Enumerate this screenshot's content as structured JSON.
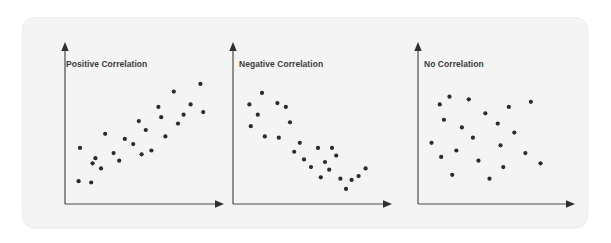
{
  "page": {
    "background_color": "#ffffff",
    "card_background_color": "#f4f4f4",
    "card_border_color": "#ededed"
  },
  "margin_artifacts": [
    {
      "glyph": "·",
      "x": 597,
      "y": 27
    },
    {
      "glyph": "·",
      "x": 596,
      "y": 40
    },
    {
      "glyph": "·",
      "x": 595,
      "y": 180
    },
    {
      "glyph": "·",
      "x": 595,
      "y": 200
    }
  ],
  "chart_data": [
    {
      "type": "scatter",
      "title": "Positive Correlation",
      "xlabel": "",
      "ylabel": "",
      "xlim": [
        0,
        100
      ],
      "ylim": [
        0,
        100
      ],
      "grid": false,
      "legend": "none",
      "axis_style": "arrow-headed L-shaped axes, no tick labels",
      "point_color": "#2b2b2b",
      "point_count": 24,
      "points": [
        [
          4,
          10
        ],
        [
          5,
          36
        ],
        [
          13,
          9
        ],
        [
          14,
          24
        ],
        [
          16,
          28
        ],
        [
          20,
          20
        ],
        [
          23,
          47
        ],
        [
          29,
          32
        ],
        [
          33,
          26
        ],
        [
          37,
          43
        ],
        [
          43,
          39
        ],
        [
          47,
          57
        ],
        [
          49,
          31
        ],
        [
          52,
          50
        ],
        [
          56,
          34
        ],
        [
          61,
          68
        ],
        [
          63,
          60
        ],
        [
          66,
          45
        ],
        [
          72,
          80
        ],
        [
          75,
          55
        ],
        [
          79,
          62
        ],
        [
          84,
          70
        ],
        [
          91,
          86
        ],
        [
          93,
          64
        ]
      ]
    },
    {
      "type": "scatter",
      "title": "Negative Correlation",
      "xlabel": "",
      "ylabel": "",
      "xlim": [
        0,
        100
      ],
      "ylim": [
        0,
        100
      ],
      "grid": false,
      "legend": "none",
      "axis_style": "arrow-headed L-shaped axes, no tick labels",
      "point_color": "#2b2b2b",
      "point_count": 24,
      "points": [
        [
          6,
          70
        ],
        [
          7,
          53
        ],
        [
          12,
          62
        ],
        [
          15,
          79
        ],
        [
          17,
          45
        ],
        [
          26,
          71
        ],
        [
          27,
          44
        ],
        [
          32,
          68
        ],
        [
          35,
          56
        ],
        [
          38,
          33
        ],
        [
          42,
          40
        ],
        [
          45,
          27
        ],
        [
          50,
          21
        ],
        [
          55,
          36
        ],
        [
          57,
          13
        ],
        [
          60,
          25
        ],
        [
          63,
          19
        ],
        [
          65,
          36
        ],
        [
          68,
          30
        ],
        [
          71,
          12
        ],
        [
          75,
          4
        ],
        [
          79,
          11
        ],
        [
          84,
          14
        ],
        [
          89,
          20
        ]
      ]
    },
    {
      "type": "scatter",
      "title": "No Correlation",
      "xlabel": "",
      "ylabel": "",
      "xlim": [
        0,
        100
      ],
      "ylim": [
        0,
        100
      ],
      "grid": false,
      "legend": "none",
      "axis_style": "arrow-headed L-shaped axes, no tick labels",
      "point_color": "#2b2b2b",
      "point_count": 21,
      "points": [
        [
          4,
          40
        ],
        [
          10,
          70
        ],
        [
          11,
          29
        ],
        [
          13,
          58
        ],
        [
          17,
          76
        ],
        [
          19,
          15
        ],
        [
          22,
          34
        ],
        [
          26,
          52
        ],
        [
          31,
          74
        ],
        [
          34,
          44
        ],
        [
          38,
          26
        ],
        [
          43,
          63
        ],
        [
          46,
          12
        ],
        [
          52,
          55
        ],
        [
          54,
          38
        ],
        [
          56,
          21
        ],
        [
          60,
          68
        ],
        [
          64,
          48
        ],
        [
          72,
          32
        ],
        [
          76,
          72
        ],
        [
          83,
          24
        ]
      ]
    }
  ]
}
